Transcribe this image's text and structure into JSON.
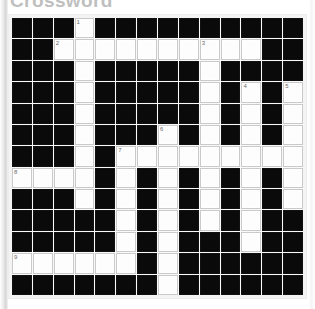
{
  "page": {
    "title": "Crossword",
    "background_color": "#ffffff"
  },
  "grid": {
    "columns": 14,
    "rows": 13,
    "black_color": "#0a0a0a",
    "white_color": "#fdfdfd",
    "border_color": "#c9c9c9",
    "number_color": "#6b6b6b",
    "legend": {
      "B": "black-block",
      "W": "white-writable-cell"
    },
    "layout": [
      "BBBWBBBBBBBBBB",
      "BBWWWWWWWWWWBB",
      "BBBWBBBBBWBBBB",
      "BBBWBBBBBWBWBW",
      "BBBWBBBBBWBWBW",
      "BBBWBBBWBWBWBW",
      "BBBWBWWWWWWWWW",
      "WWWWBWBWBWBWBW",
      "BBBWBWBWBWBWBW",
      "BBBBBWBWBWBWBB",
      "BBBBBWBWBBBWBB",
      "WWWWWWBWBBBBBB",
      "BBBBBBBWBBBBBB"
    ],
    "numbers": [
      {
        "label": "1",
        "row": 1,
        "col": 4
      },
      {
        "label": "2",
        "row": 2,
        "col": 3
      },
      {
        "label": "3",
        "row": 2,
        "col": 10
      },
      {
        "label": "4",
        "row": 4,
        "col": 12
      },
      {
        "label": "5",
        "row": 4,
        "col": 14
      },
      {
        "label": "6",
        "row": 6,
        "col": 8
      },
      {
        "label": "7",
        "row": 7,
        "col": 6
      },
      {
        "label": "8",
        "row": 8,
        "col": 1
      },
      {
        "label": "9",
        "row": 12,
        "col": 1
      }
    ]
  }
}
